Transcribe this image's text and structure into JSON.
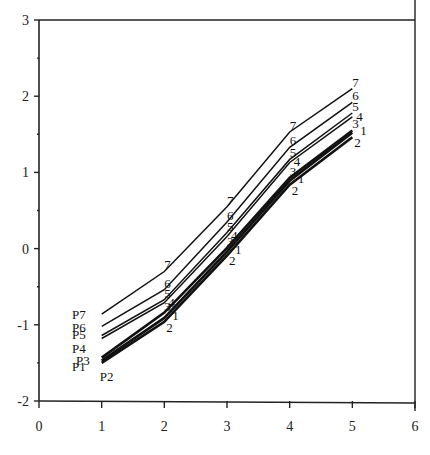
{
  "chart_data": {
    "type": "line",
    "title": "",
    "xlabel": "",
    "ylabel": "",
    "xlim": [
      0,
      6
    ],
    "ylim": [
      -2,
      3
    ],
    "x_ticks": [
      "0",
      "1",
      "2",
      "3",
      "4",
      "5",
      "6"
    ],
    "y_ticks": [
      "-2",
      "-1",
      "0",
      "1",
      "2",
      "3"
    ],
    "grid": false,
    "legend": "inline labels: P1-P7 at left end, digits 1-7 at each point",
    "x": [
      1,
      2,
      3,
      4,
      5
    ],
    "series": [
      {
        "name": "P1",
        "marker": "1",
        "values": [
          -1.47,
          -0.91,
          -0.04,
          0.89,
          1.52
        ],
        "weight": "bold"
      },
      {
        "name": "P2",
        "marker": "2",
        "values": [
          -1.5,
          -0.96,
          -0.09,
          0.84,
          1.46
        ],
        "weight": "bold"
      },
      {
        "name": "P3",
        "marker": "3",
        "values": [
          -1.43,
          -0.84,
          0.01,
          0.93,
          1.55
        ],
        "weight": "bold"
      },
      {
        "name": "P4",
        "marker": "4",
        "values": [
          -1.18,
          -0.71,
          0.16,
          1.13,
          1.73
        ],
        "weight": "normal"
      },
      {
        "name": "P5",
        "marker": "5",
        "values": [
          -1.14,
          -0.67,
          0.21,
          1.17,
          1.78
        ],
        "weight": "normal"
      },
      {
        "name": "P6",
        "marker": "6",
        "values": [
          -1.02,
          -0.54,
          0.35,
          1.33,
          1.92
        ],
        "weight": "normal"
      },
      {
        "name": "P7",
        "marker": "7",
        "values": [
          -0.86,
          -0.3,
          0.55,
          1.53,
          2.1
        ],
        "weight": "normal"
      }
    ]
  }
}
